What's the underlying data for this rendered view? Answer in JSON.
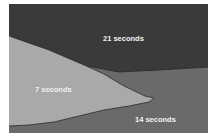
{
  "diagram": {
    "regions": [
      {
        "id": "region-21",
        "label": "21 seconds",
        "color": "#3a3a3a"
      },
      {
        "id": "region-14",
        "label": "14 seconds",
        "color": "#6a6a6a"
      },
      {
        "id": "region-7",
        "label": "7 seconds",
        "color": "#a9a9a9"
      }
    ]
  }
}
